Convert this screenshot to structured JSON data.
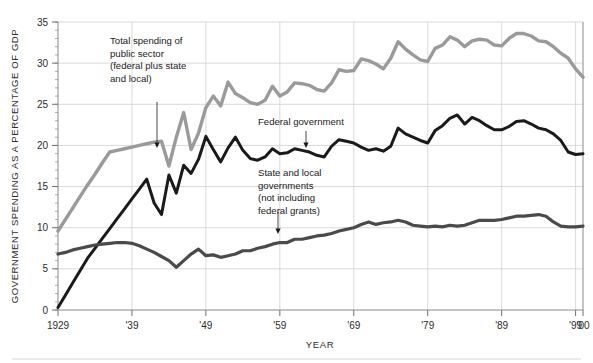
{
  "chart_data": {
    "type": "line",
    "title": "",
    "xlabel": "YEAR",
    "ylabel": "GOVERNMENT SPENDING AS A PERCENTAGE OF GDP",
    "xlim": [
      1929,
      2000
    ],
    "ylim": [
      0,
      35
    ],
    "y_major_step": 5,
    "y_minor_step": 1,
    "grid": true,
    "legend_position": "inline-annotations",
    "x_tick_labels": [
      "1929",
      "'39",
      "'49",
      "'59",
      "'69",
      "'79",
      "'89",
      "'99",
      "'00"
    ],
    "x_tick_values": [
      1929,
      1939,
      1949,
      1959,
      1969,
      1979,
      1989,
      1999,
      2000
    ],
    "y_tick_labels": [
      "0",
      "5",
      "10",
      "15",
      "20",
      "25",
      "30",
      "35"
    ],
    "y_tick_values": [
      0,
      5,
      10,
      15,
      20,
      25,
      30,
      35
    ],
    "x": [
      1929,
      1930,
      1931,
      1932,
      1933,
      1934,
      1935,
      1936,
      1937,
      1938,
      1939,
      1940,
      1941,
      1942,
      1943,
      1944,
      1945,
      1946,
      1947,
      1948,
      1949,
      1950,
      1951,
      1952,
      1953,
      1954,
      1955,
      1956,
      1957,
      1958,
      1959,
      1960,
      1961,
      1962,
      1963,
      1964,
      1965,
      1966,
      1967,
      1968,
      1969,
      1970,
      1971,
      1972,
      1973,
      1974,
      1975,
      1976,
      1977,
      1978,
      1979,
      1980,
      1981,
      1982,
      1983,
      1984,
      1985,
      1986,
      1987,
      1988,
      1989,
      1990,
      1991,
      1992,
      1993,
      1994,
      1995,
      1996,
      1997,
      1998,
      1999,
      2000
    ],
    "series": [
      {
        "name": "Total spending of public sector (federal plus state and local)",
        "color": "#9a9a9a",
        "stroke_width": 3.4,
        "values": [
          9.6,
          11.0,
          12.4,
          13.8,
          15.2,
          16.5,
          17.9,
          19.2,
          19.4,
          19.6,
          19.8,
          20.0,
          20.2,
          20.4,
          20.5,
          17.5,
          21.0,
          24.0,
          19.5,
          21.5,
          24.6,
          26.0,
          24.8,
          27.7,
          26.3,
          25.8,
          25.2,
          25.0,
          25.5,
          27.2,
          26.0,
          26.5,
          27.6,
          27.5,
          27.3,
          26.8,
          26.6,
          27.6,
          29.2,
          29.0,
          29.1,
          30.5,
          30.3,
          29.9,
          29.3,
          30.6,
          32.6,
          31.7,
          31.0,
          30.4,
          30.2,
          31.8,
          32.2,
          33.2,
          32.8,
          32.0,
          32.7,
          32.9,
          32.8,
          32.2,
          32.1,
          33.0,
          33.6,
          33.6,
          33.3,
          32.7,
          32.6,
          32.0,
          31.2,
          30.6,
          29.3,
          28.3
        ]
      },
      {
        "name": "Federal government",
        "color": "#1a1a1a",
        "stroke_width": 3.0,
        "values": [
          0.3,
          1.8,
          3.3,
          4.8,
          6.3,
          7.5,
          8.7,
          9.9,
          11.1,
          12.3,
          13.5,
          14.7,
          15.9,
          13.0,
          11.6,
          16.4,
          14.2,
          17.6,
          16.6,
          18.3,
          21.1,
          19.5,
          18.0,
          19.7,
          21.0,
          19.4,
          18.4,
          18.2,
          18.6,
          19.6,
          19.0,
          19.1,
          19.6,
          19.4,
          19.2,
          18.8,
          18.6,
          19.9,
          20.7,
          20.5,
          20.3,
          19.8,
          19.4,
          19.6,
          19.3,
          19.9,
          22.1,
          21.4,
          21.0,
          20.6,
          20.3,
          21.8,
          22.4,
          23.3,
          23.7,
          22.6,
          23.4,
          23.0,
          22.4,
          21.9,
          21.9,
          22.3,
          22.9,
          23.0,
          22.6,
          22.1,
          21.9,
          21.4,
          20.6,
          19.2,
          18.9,
          19.0
        ]
      },
      {
        "name": "State and local governments (not including federal grants)",
        "color": "#4a4a4a",
        "stroke_width": 3.2,
        "values": [
          6.8,
          7.0,
          7.3,
          7.5,
          7.7,
          7.9,
          8.0,
          8.1,
          8.2,
          8.2,
          8.1,
          7.8,
          7.4,
          7.0,
          6.5,
          6.0,
          5.2,
          6.0,
          6.8,
          7.4,
          6.6,
          6.7,
          6.4,
          6.6,
          6.8,
          7.2,
          7.2,
          7.5,
          7.7,
          8.0,
          8.2,
          8.2,
          8.6,
          8.6,
          8.8,
          9.0,
          9.1,
          9.3,
          9.6,
          9.8,
          10.0,
          10.4,
          10.7,
          10.4,
          10.6,
          10.7,
          10.9,
          10.7,
          10.3,
          10.2,
          10.1,
          10.2,
          10.1,
          10.3,
          10.2,
          10.3,
          10.6,
          10.9,
          10.9,
          10.9,
          11.0,
          11.2,
          11.4,
          11.4,
          11.5,
          11.6,
          11.4,
          10.7,
          10.2,
          10.1,
          10.1,
          10.2
        ]
      }
    ],
    "annotations": [
      {
        "id": "total-spending",
        "lines": [
          "Total spending of",
          "public sector",
          "(federal plus state",
          "and local)"
        ],
        "text_x": 110,
        "text_y": 44,
        "leader_from": [
          157,
          102
        ],
        "leader_to": [
          157,
          148
        ]
      },
      {
        "id": "federal-government",
        "lines": [
          "Federal government"
        ],
        "text_x": 258,
        "text_y": 125,
        "leader_from": [
          306,
          131
        ],
        "leader_to": [
          306,
          148
        ]
      },
      {
        "id": "state-local-governments",
        "lines": [
          "State and local",
          "governments",
          "(not including",
          "federal grants)"
        ],
        "text_x": 258,
        "text_y": 176,
        "leader_from": [
          278,
          212
        ],
        "leader_to": [
          278,
          234
        ]
      }
    ]
  }
}
